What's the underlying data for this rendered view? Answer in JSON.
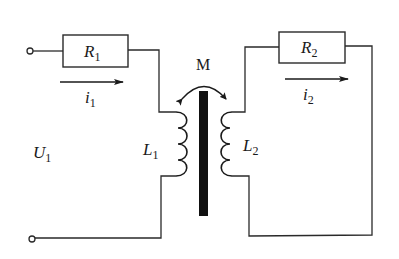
{
  "diagram": {
    "type": "coupled-inductor circuit (transformer)",
    "labels": {
      "R1": {
        "main": "R",
        "sub": "1"
      },
      "R2": {
        "main": "R",
        "sub": "2"
      },
      "L1": {
        "main": "L",
        "sub": "1"
      },
      "L2": {
        "main": "L",
        "sub": "2"
      },
      "U1": {
        "main": "U",
        "sub": "1"
      },
      "i1": {
        "main": "i",
        "sub": "1"
      },
      "i2": {
        "main": "i",
        "sub": "2"
      },
      "M": "M"
    },
    "components": [
      {
        "id": "R1",
        "kind": "resistor",
        "circuit": "primary"
      },
      {
        "id": "L1",
        "kind": "inductor",
        "circuit": "primary"
      },
      {
        "id": "R2",
        "kind": "resistor",
        "circuit": "secondary"
      },
      {
        "id": "L2",
        "kind": "inductor",
        "circuit": "secondary"
      },
      {
        "id": "core",
        "kind": "iron-core",
        "circuit": "coupling"
      }
    ],
    "currents": [
      {
        "id": "i1",
        "direction": "right"
      },
      {
        "id": "i2",
        "direction": "right"
      }
    ],
    "colors": {
      "line": "#2a2a2a",
      "core": "#111111",
      "background": "#ffffff"
    }
  }
}
